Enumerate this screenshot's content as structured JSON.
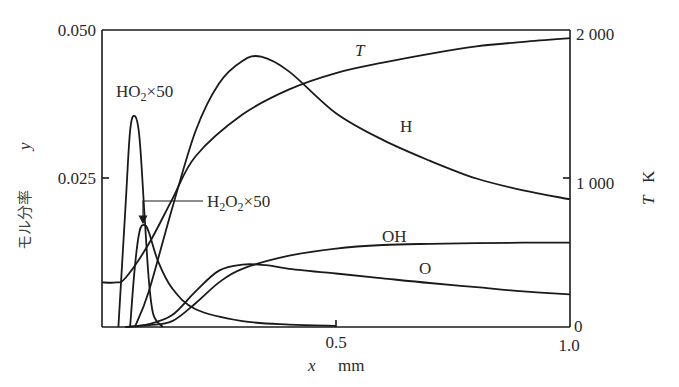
{
  "chart_data": {
    "type": "line",
    "title": "",
    "xlabel": "x mm",
    "ylabel_left": "モル分率 y",
    "ylabel_right": "T K",
    "xlim": [
      0,
      1.0
    ],
    "ylim_left": [
      0,
      0.05
    ],
    "ylim_right": [
      0,
      2000
    ],
    "x_ticks": [
      "0.5",
      "1.0"
    ],
    "y_left_ticks": [
      "0.025",
      "0.050"
    ],
    "y_right_ticks": [
      "0",
      "1 000",
      "2 000"
    ],
    "grid": false,
    "series": [
      {
        "name": "T",
        "axis": "right",
        "unit": "K",
        "x": [
          0,
          0.03,
          0.05,
          0.1,
          0.15,
          0.2,
          0.3,
          0.4,
          0.5,
          0.6,
          0.7,
          0.8,
          0.9,
          1.0
        ],
        "values": [
          300,
          300,
          330,
          560,
          860,
          1150,
          1430,
          1600,
          1710,
          1780,
          1840,
          1890,
          1920,
          1945
        ]
      },
      {
        "name": "H",
        "axis": "left",
        "x": [
          0.07,
          0.1,
          0.15,
          0.2,
          0.25,
          0.3,
          0.34,
          0.4,
          0.5,
          0.6,
          0.7,
          0.8,
          0.9,
          1.0
        ],
        "values": [
          0,
          0.006,
          0.02,
          0.033,
          0.041,
          0.0448,
          0.0455,
          0.043,
          0.036,
          0.0315,
          0.028,
          0.025,
          0.023,
          0.0215
        ]
      },
      {
        "name": "HO2×50",
        "axis": "left",
        "x": [
          0.035,
          0.05,
          0.06,
          0.07,
          0.08,
          0.09,
          0.1,
          0.11,
          0.13
        ],
        "values": [
          0,
          0.02,
          0.033,
          0.0355,
          0.032,
          0.02,
          0.008,
          0.002,
          0
        ]
      },
      {
        "name": "H2O2×50",
        "axis": "left",
        "x": [
          0.06,
          0.07,
          0.08,
          0.09,
          0.1,
          0.12,
          0.15,
          0.2,
          0.3,
          0.4,
          0.5
        ],
        "values": [
          0,
          0.01,
          0.016,
          0.0172,
          0.016,
          0.011,
          0.0065,
          0.003,
          0.001,
          0.0004,
          0.0002
        ]
      },
      {
        "name": "OH",
        "axis": "left",
        "x": [
          0.05,
          0.1,
          0.15,
          0.2,
          0.25,
          0.3,
          0.4,
          0.5,
          0.6,
          0.7,
          0.8,
          0.9,
          1.0
        ],
        "values": [
          0,
          0.0003,
          0.001,
          0.004,
          0.0075,
          0.0098,
          0.012,
          0.0132,
          0.0138,
          0.014,
          0.0141,
          0.0142,
          0.0142
        ]
      },
      {
        "name": "O",
        "axis": "left",
        "x": [
          0.05,
          0.1,
          0.15,
          0.2,
          0.25,
          0.3,
          0.35,
          0.4,
          0.5,
          0.6,
          0.7,
          0.8,
          0.9,
          1.0
        ],
        "values": [
          0,
          0.0005,
          0.002,
          0.006,
          0.0095,
          0.0105,
          0.0104,
          0.0098,
          0.009,
          0.0082,
          0.0074,
          0.0067,
          0.006,
          0.0055
        ]
      }
    ],
    "annotations": [
      "T",
      "H",
      "HO2×50",
      "H2O2×50",
      "OH",
      "O"
    ]
  },
  "labels": {
    "y_left_top": "0.050",
    "y_left_mid": "0.025",
    "y_right_top": "2 000",
    "y_right_mid": "1 000",
    "y_right_zero": "0",
    "x_mid": "0.5",
    "x_end": "1.0",
    "x_var": "x",
    "x_unit": "mm",
    "y_left_title": "モル分率",
    "y_left_var": "y",
    "y_right_var": "T",
    "y_right_unit": "K",
    "curve_T": "T",
    "curve_H": "H",
    "curve_HO2_main": "HO",
    "curve_HO2_sub": "2",
    "curve_HO2_mult": "×50",
    "curve_H2O2_a": "H",
    "curve_H2O2_sub1": "2",
    "curve_H2O2_b": "O",
    "curve_H2O2_sub2": "2",
    "curve_H2O2_mult": "×50",
    "curve_OH": "OH",
    "curve_O": "O"
  }
}
